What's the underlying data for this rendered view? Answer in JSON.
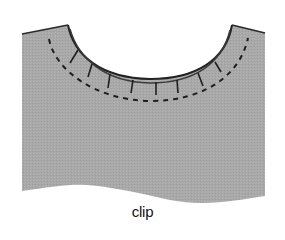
{
  "figure": {
    "caption": "clip",
    "fabric_color": "#a9a9a9",
    "edge_color": "#2a2a2a",
    "stitch_color": "#1e1e1e"
  }
}
